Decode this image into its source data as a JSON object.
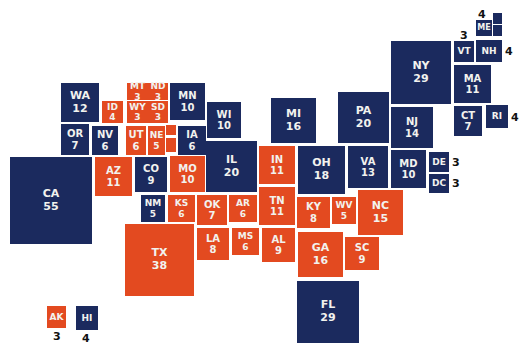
{
  "chart_data": {
    "type": "cartogram",
    "title": "",
    "colors": {
      "dem": "#1b2a5e",
      "rep": "#e34a20"
    },
    "states": [
      {
        "abbr": "WA",
        "ev": 12,
        "party": "dem",
        "x": 61,
        "y": 83,
        "w": 38,
        "h": 39,
        "fs": 11
      },
      {
        "abbr": "OR",
        "ev": 7,
        "party": "dem",
        "x": 61,
        "y": 124,
        "w": 28,
        "h": 31,
        "fs": 10
      },
      {
        "abbr": "CA",
        "ev": 55,
        "party": "dem",
        "x": 10,
        "y": 157,
        "w": 82,
        "h": 87,
        "fs": 11
      },
      {
        "abbr": "ID",
        "ev": 4,
        "party": "rep",
        "x": 102,
        "y": 101,
        "w": 21,
        "h": 22,
        "fs": 9
      },
      {
        "abbr": "NV",
        "ev": 6,
        "party": "dem",
        "x": 92,
        "y": 126,
        "w": 26,
        "h": 29,
        "fs": 10
      },
      {
        "abbr": "MT",
        "ev": 3,
        "party": "rep",
        "x": 127,
        "y": 83,
        "w": 21,
        "h": 17,
        "fs": 9
      },
      {
        "abbr": "WY",
        "ev": 3,
        "party": "rep",
        "x": 127,
        "y": 101,
        "w": 21,
        "h": 22,
        "fs": 9
      },
      {
        "abbr": "UT",
        "ev": 6,
        "party": "rep",
        "x": 126,
        "y": 126,
        "w": 20,
        "h": 29,
        "fs": 10
      },
      {
        "abbr": "AZ",
        "ev": 11,
        "party": "rep",
        "x": 95,
        "y": 157,
        "w": 37,
        "h": 39,
        "fs": 10
      },
      {
        "abbr": "ND",
        "ev": 3,
        "party": "rep",
        "x": 148,
        "y": 83,
        "w": 20,
        "h": 17,
        "fs": 9
      },
      {
        "abbr": "SD",
        "ev": 3,
        "party": "rep",
        "x": 148,
        "y": 101,
        "w": 20,
        "h": 22,
        "fs": 9
      },
      {
        "abbr": "NE",
        "ev": 5,
        "party": "rep",
        "x": 148,
        "y": 126,
        "w": 17,
        "h": 29,
        "fs": 9
      },
      {
        "abbr": "CO",
        "ev": 9,
        "party": "dem",
        "x": 135,
        "y": 157,
        "w": 32,
        "h": 35,
        "fs": 10
      },
      {
        "abbr": "NM",
        "ev": 5,
        "party": "dem",
        "x": 141,
        "y": 195,
        "w": 24,
        "h": 27,
        "fs": 9
      },
      {
        "abbr": "MN",
        "ev": 10,
        "party": "dem",
        "x": 170,
        "y": 83,
        "w": 35,
        "h": 37,
        "fs": 10
      },
      {
        "abbr": "IA",
        "ev": 6,
        "party": "dem",
        "x": 178,
        "y": 126,
        "w": 28,
        "h": 29,
        "fs": 10
      },
      {
        "abbr": "MO",
        "ev": 10,
        "party": "rep",
        "x": 170,
        "y": 156,
        "w": 35,
        "h": 36,
        "fs": 10
      },
      {
        "abbr": "KS",
        "ev": 6,
        "party": "rep",
        "x": 168,
        "y": 195,
        "w": 27,
        "h": 27,
        "fs": 9
      },
      {
        "abbr": "OK",
        "ev": 7,
        "party": "rep",
        "x": 197,
        "y": 195,
        "w": 30,
        "h": 30,
        "fs": 10
      },
      {
        "abbr": "TX",
        "ev": 38,
        "party": "rep",
        "x": 125,
        "y": 224,
        "w": 69,
        "h": 72,
        "fs": 11
      },
      {
        "abbr": "WI",
        "ev": 10,
        "party": "dem",
        "x": 207,
        "y": 102,
        "w": 34,
        "h": 36,
        "fs": 10
      },
      {
        "abbr": "IL",
        "ev": 20,
        "party": "dem",
        "x": 206,
        "y": 141,
        "w": 51,
        "h": 51,
        "fs": 11
      },
      {
        "abbr": "AR",
        "ev": 6,
        "party": "rep",
        "x": 229,
        "y": 195,
        "w": 28,
        "h": 27,
        "fs": 9
      },
      {
        "abbr": "LA",
        "ev": 8,
        "party": "rep",
        "x": 197,
        "y": 228,
        "w": 32,
        "h": 32,
        "fs": 10
      },
      {
        "abbr": "MS",
        "ev": 6,
        "party": "rep",
        "x": 232,
        "y": 228,
        "w": 27,
        "h": 27,
        "fs": 9
      },
      {
        "abbr": "MI",
        "ev": 16,
        "party": "dem",
        "x": 271,
        "y": 98,
        "w": 45,
        "h": 45,
        "fs": 11
      },
      {
        "abbr": "IN",
        "ev": 11,
        "party": "rep",
        "x": 259,
        "y": 146,
        "w": 36,
        "h": 38,
        "fs": 10
      },
      {
        "abbr": "TN",
        "ev": 11,
        "party": "rep",
        "x": 259,
        "y": 187,
        "w": 36,
        "h": 38,
        "fs": 10
      },
      {
        "abbr": "AL",
        "ev": 9,
        "party": "rep",
        "x": 262,
        "y": 228,
        "w": 33,
        "h": 34,
        "fs": 10
      },
      {
        "abbr": "OH",
        "ev": 18,
        "party": "dem",
        "x": 298,
        "y": 146,
        "w": 47,
        "h": 48,
        "fs": 11
      },
      {
        "abbr": "KY",
        "ev": 8,
        "party": "rep",
        "x": 297,
        "y": 197,
        "w": 33,
        "h": 31,
        "fs": 10
      },
      {
        "abbr": "WV",
        "ev": 5,
        "party": "rep",
        "x": 332,
        "y": 197,
        "w": 24,
        "h": 27,
        "fs": 9
      },
      {
        "abbr": "GA",
        "ev": 16,
        "party": "rep",
        "x": 298,
        "y": 232,
        "w": 45,
        "h": 45,
        "fs": 11
      },
      {
        "abbr": "FL",
        "ev": 29,
        "party": "dem",
        "x": 297,
        "y": 281,
        "w": 62,
        "h": 62,
        "fs": 11
      },
      {
        "abbr": "PA",
        "ev": 20,
        "party": "dem",
        "x": 338,
        "y": 92,
        "w": 51,
        "h": 51,
        "fs": 11
      },
      {
        "abbr": "VA",
        "ev": 13,
        "party": "dem",
        "x": 348,
        "y": 146,
        "w": 40,
        "h": 42,
        "fs": 10
      },
      {
        "abbr": "NC",
        "ev": 15,
        "party": "rep",
        "x": 358,
        "y": 190,
        "w": 45,
        "h": 45,
        "fs": 11
      },
      {
        "abbr": "SC",
        "ev": 9,
        "party": "rep",
        "x": 345,
        "y": 237,
        "w": 34,
        "h": 33,
        "fs": 10
      },
      {
        "abbr": "NY",
        "ev": 29,
        "party": "dem",
        "x": 391,
        "y": 41,
        "w": 60,
        "h": 63,
        "fs": 11
      },
      {
        "abbr": "NJ",
        "ev": 14,
        "party": "dem",
        "x": 391,
        "y": 107,
        "w": 42,
        "h": 41,
        "fs": 10
      },
      {
        "abbr": "MD",
        "ev": 10,
        "party": "dem",
        "x": 391,
        "y": 150,
        "w": 35,
        "h": 38,
        "fs": 10
      },
      {
        "abbr": "VT",
        "ev": 3,
        "party": "dem",
        "x": 454,
        "y": 41,
        "w": 20,
        "h": 21,
        "fs": 9,
        "label_out": true
      },
      {
        "abbr": "NH",
        "ev": 4,
        "party": "dem",
        "x": 476,
        "y": 40,
        "w": 26,
        "h": 22,
        "fs": 9,
        "label_out": true
      },
      {
        "abbr": "MA",
        "ev": 11,
        "party": "dem",
        "x": 454,
        "y": 65,
        "w": 37,
        "h": 38,
        "fs": 10
      },
      {
        "abbr": "CT",
        "ev": 7,
        "party": "dem",
        "x": 454,
        "y": 106,
        "w": 28,
        "h": 30,
        "fs": 10
      },
      {
        "abbr": "RI",
        "ev": 4,
        "party": "dem",
        "x": 486,
        "y": 105,
        "w": 22,
        "h": 23,
        "fs": 9,
        "label_out": true
      },
      {
        "abbr": "ME",
        "ev": 4,
        "party": "dem",
        "x": 476,
        "y": 20,
        "w": 16,
        "h": 16,
        "fs": 8,
        "label_out": true
      },
      {
        "abbr": "DE",
        "ev": 3,
        "party": "dem",
        "x": 429,
        "y": 152,
        "w": 20,
        "h": 20,
        "fs": 9,
        "label_out": true
      },
      {
        "abbr": "DC",
        "ev": 3,
        "party": "dem",
        "x": 429,
        "y": 174,
        "w": 20,
        "h": 19,
        "fs": 9,
        "label_out": true
      },
      {
        "abbr": "AK",
        "ev": 3,
        "party": "rep",
        "x": 47,
        "y": 306,
        "w": 19,
        "h": 22,
        "fs": 9,
        "label_out": true
      },
      {
        "abbr": "HI",
        "ev": 4,
        "party": "dem",
        "x": 76,
        "y": 306,
        "w": 22,
        "h": 24,
        "fs": 9,
        "label_out": true
      }
    ],
    "split_tiles": [
      {
        "name": "ME-district-1",
        "party": "dem",
        "x": 493,
        "y": 13,
        "w": 9,
        "h": 11
      },
      {
        "name": "ME-district-2",
        "party": "dem",
        "x": 493,
        "y": 25,
        "w": 9,
        "h": 11
      },
      {
        "name": "NE-district-a",
        "party": "rep",
        "x": 166,
        "y": 125,
        "w": 10,
        "h": 10
      },
      {
        "name": "NE-district-b",
        "party": "rep",
        "x": 166,
        "y": 138,
        "w": 10,
        "h": 14
      }
    ],
    "outside_labels": [
      {
        "state": "ME",
        "text": "4",
        "x": 478,
        "y": 8
      },
      {
        "state": "VT",
        "text": "3",
        "x": 460,
        "y": 29
      },
      {
        "state": "NH",
        "text": "4",
        "x": 505,
        "y": 45
      },
      {
        "state": "RI",
        "text": "4",
        "x": 511,
        "y": 111
      },
      {
        "state": "DE",
        "text": "3",
        "x": 452,
        "y": 156
      },
      {
        "state": "DC",
        "text": "3",
        "x": 452,
        "y": 177
      },
      {
        "state": "AK",
        "text": "3",
        "x": 53,
        "y": 330
      },
      {
        "state": "HI",
        "text": "4",
        "x": 82,
        "y": 332
      }
    ],
    "totals": {
      "dem": 0,
      "rep": 0
    }
  }
}
